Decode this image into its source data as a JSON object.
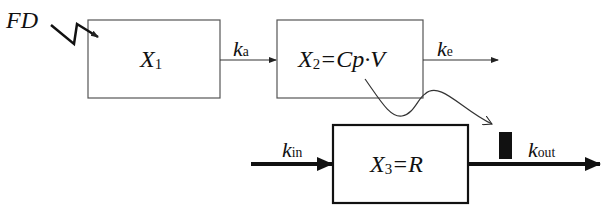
{
  "diagram": {
    "dose_label": "FD",
    "compartments": [
      {
        "id": "x1",
        "var": "X",
        "sub": "1",
        "expr": ""
      },
      {
        "id": "x2",
        "var": "X",
        "sub": "2",
        "expr": "=Cp·V"
      },
      {
        "id": "x3",
        "var": "X",
        "sub": "3",
        "expr": "=R"
      }
    ],
    "rates": {
      "ka": {
        "k": "k",
        "sub": "a"
      },
      "ke": {
        "k": "k",
        "sub": "e"
      },
      "kin": {
        "k": "k",
        "sub": "in"
      },
      "kout": {
        "k": "k",
        "sub": "out"
      }
    },
    "colors": {
      "line": "#222222",
      "background": "#ffffff"
    }
  }
}
